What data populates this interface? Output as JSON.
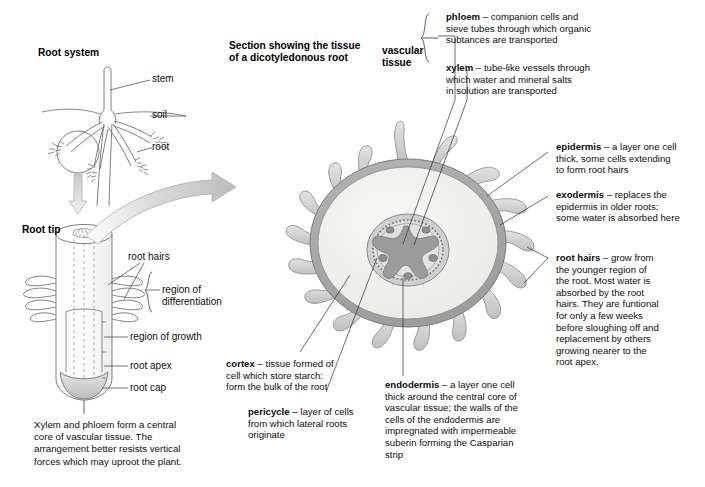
{
  "figure": {
    "title": "Section showing the tissue of a dicotyledonous root",
    "title_line1": "Section showing the tissue",
    "title_line2": "of a dicotyledonous root"
  },
  "root_system": {
    "heading": "Root system",
    "labels": {
      "stem": "stem",
      "soil": "soil",
      "root": "root"
    }
  },
  "root_tip": {
    "heading": "Root tip",
    "labels": {
      "root_hairs": "root hairs",
      "region_of_differentiation_line1": "region of",
      "region_of_differentiation_line2": "differentiation",
      "region_of_growth": "region of growth",
      "root_apex": "root apex",
      "root_cap": "root cap"
    },
    "caption": "Xylem and phloem form a central core of vascular tissue. The arrangement better resists vertical forces which may uproot the plant.",
    "caption_lines": [
      "Xylem and phloem form a central",
      "core of vascular tissue. The",
      "arrangement better resists vertical",
      "forces which may uproot the plant."
    ]
  },
  "vascular_group": {
    "label_line1": "vascular",
    "label_line2": "tissue"
  },
  "annotations": {
    "phloem": {
      "term": "phloem",
      "dash": " – ",
      "text": "companion cells and sieve tubes through which organic subtances are transported",
      "lines": [
        "companion cells and",
        "sieve tubes through which organic",
        "subtances are transported"
      ]
    },
    "xylem": {
      "term": "xylem",
      "dash": " – ",
      "text": "tube-like vessels through which water and mineral salts in solution are transported",
      "lines": [
        "tube-like vessels through",
        "which water and mineral salts",
        "in solution are transported"
      ]
    },
    "epidermis": {
      "term": "epidermis",
      "dash": " – ",
      "text": "a layer one cell thick, some cells extending to form root hairs",
      "lines": [
        "a layer one cell",
        "thick, some cells extending",
        "to form root hairs"
      ]
    },
    "exodermis": {
      "term": "exodermis",
      "dash": " – ",
      "text": "replaces the epidermis in older roots; some water is absorbed here",
      "lines": [
        "replaces the",
        "epidermis in older roots;",
        "some water is absorbed here"
      ]
    },
    "root_hairs": {
      "term": "root hairs",
      "dash": " – ",
      "text": "grow from the younger region of the root. Most water is absorbed by the root hairs. They are funtional for only a few weeks before sloughing off and replacement by others growing nearer to the root apex.",
      "lines": [
        "grow from",
        "the younger region of",
        "the root. Most water is",
        "absorbed by the root",
        "hairs. They are funtional",
        "for only a few weeks",
        "before sloughing off and",
        "replacement by others",
        "growing nearer to the",
        "root apex."
      ]
    },
    "cortex": {
      "term": "cortex",
      "dash": " – ",
      "text": "tissue formed of cell which store starch: form the bulk of the root",
      "lines": [
        "tissue formed of",
        "cell which store starch:",
        "form the bulk of the root"
      ]
    },
    "pericycle": {
      "term": "pericycle",
      "dash": " – ",
      "text": "layer of cells from which lateral roots originate",
      "lines": [
        "layer of cells",
        "from which lateral roots",
        "originate"
      ]
    },
    "endodermis": {
      "term": "endodermis",
      "dash": " – ",
      "text": "a layer one cell thick around the central core of vascular tissue; the walls of the cells of the endodermis are impregnated with impermeable suberin forming the Casparian strip",
      "lines": [
        "a layer one cell",
        "thick around the central core of",
        "vascular tissue; the walls of the",
        "cells of the endodermis are",
        "impregnated with impermeable",
        "suberin forming the Casparian",
        "strip"
      ]
    }
  },
  "colors": {
    "ink": "#101010",
    "outline": "#6f6f6f",
    "epidermis_ring": "#a9a9a9",
    "cortex_fill": "#f1f1ef",
    "stele_ring": "#a3a3a3",
    "stele_fill": "#dedede",
    "xylem_fill": "#9a9a9a",
    "phloem_fill": "#8f8f8f",
    "root_hair_fill": "#cfcfcf",
    "arrow_fill": "#d7d7d7",
    "root_cap_fill": "#cfcfcf",
    "background": "#ffffff"
  }
}
